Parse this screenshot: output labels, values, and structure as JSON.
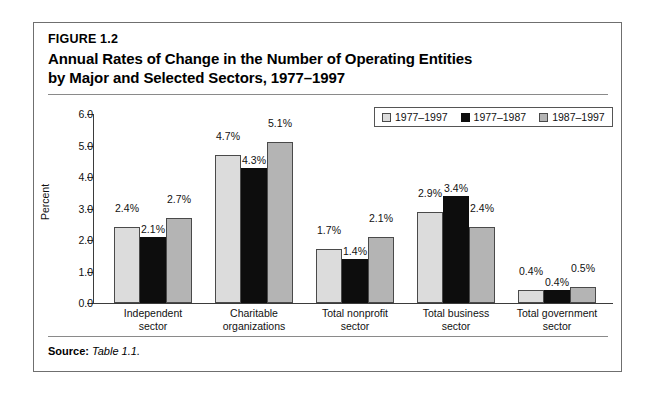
{
  "figure": {
    "number": "FIGURE 1.2",
    "title_line1": "Annual Rates of Change in the Number of Operating Entities",
    "title_line2": "by Major and Selected Sectors, 1977–1997",
    "source_label": "Source:",
    "source_value": "Table 1.1."
  },
  "colors": {
    "series_1977_1997": "#dcdcdc",
    "series_1977_1987": "#0d0d0d",
    "series_1987_1997": "#b4b4b4",
    "axis": "#3b3b3b",
    "frame": "#6f6f6f",
    "rule": "#8a8a8a"
  },
  "chart_data": {
    "type": "bar",
    "title": "Annual Rates of Change in the Number of Operating Entities by Major and Selected Sectors, 1977–1997",
    "xlabel": "",
    "ylabel": "Percent",
    "ylim": [
      0.0,
      6.0
    ],
    "ytick_labels": [
      "0.0",
      "1.0",
      "2.0",
      "3.0",
      "4.0",
      "5.0",
      "6.0"
    ],
    "ytick_values": [
      0.0,
      1.0,
      2.0,
      3.0,
      4.0,
      5.0,
      6.0
    ],
    "grid": false,
    "legend_position": "top-right",
    "categories": [
      "Independent sector",
      "Charitable organizations",
      "Total nonprofit sector",
      "Total business sector",
      "Total government sector"
    ],
    "category_lines": [
      [
        "Independent",
        "sector"
      ],
      [
        "Charitable",
        "organizations"
      ],
      [
        "Total nonprofit",
        "sector"
      ],
      [
        "Total business",
        "sector"
      ],
      [
        "Total government",
        "sector"
      ]
    ],
    "series": [
      {
        "name": "1977–1997",
        "color": "#dcdcdc",
        "values": [
          2.4,
          4.7,
          1.7,
          2.9,
          0.4
        ],
        "labels": [
          "2.4%",
          "4.7%",
          "1.7%",
          "2.9%",
          "0.4%"
        ]
      },
      {
        "name": "1977–1987",
        "color": "#0d0d0d",
        "values": [
          2.1,
          4.3,
          1.4,
          3.4,
          0.4
        ],
        "labels": [
          "2.1%",
          "4.3%",
          "1.4%",
          "3.4%",
          "0.4%"
        ]
      },
      {
        "name": "1987–1997",
        "color": "#b4b4b4",
        "values": [
          2.7,
          5.1,
          2.1,
          2.4,
          0.5
        ],
        "labels": [
          "2.7%",
          "5.1%",
          "2.1%",
          "2.4%",
          "0.5%"
        ]
      }
    ]
  }
}
